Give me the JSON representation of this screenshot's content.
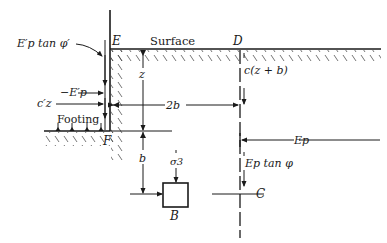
{
  "diagram": {
    "type": "soil-mechanics-bearing-capacity",
    "colors": {
      "ink": "#1a1a1a",
      "background": "#ffffff"
    },
    "points": {
      "E": "E",
      "D": "D",
      "F": "F",
      "C": "C",
      "B": "B"
    },
    "labels": {
      "surface": "Surface",
      "footing": "Footing",
      "ep_prime_tan_phi_prime": "E′p tan φ′",
      "neg_ep_prime": "−E′p",
      "c_prime_z": "c′z",
      "two_b": "2b",
      "z": "z",
      "b": "b",
      "c_z_plus_b": "c(z + b)",
      "ep": "Ep",
      "ep_tan_phi": "Ep tan φ",
      "sigma_3": "σ3"
    }
  }
}
